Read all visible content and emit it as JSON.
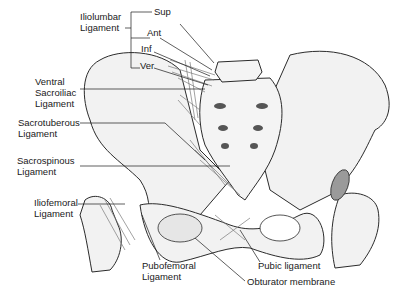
{
  "figure": {
    "colors": {
      "background": "#ffffff",
      "bone_fill": "#f2f2f2",
      "bone_outline": "#2b2b2b",
      "ligament": "#7a7a7a",
      "cartilage_fill": "#9a9a9a",
      "leader_line": "#1a1a1a",
      "text": "#1a1a1a"
    }
  },
  "labels": {
    "iliolumbar": {
      "line1": "Iliolumbar",
      "line2": "Ligament"
    },
    "iliolumbar_parts": {
      "sup": "Sup",
      "ant": "Ant",
      "inf": "Inf",
      "ver": "Ver"
    },
    "ventral_sacroiliac": {
      "line1": "Ventral",
      "line2": "Sacroiliac",
      "line3": "Ligament"
    },
    "sacrotuberous": {
      "line1": "Sacrotuberous",
      "line2": "Ligament"
    },
    "sacrospinous": {
      "line1": "Sacrospinous",
      "line2": "Ligament"
    },
    "iliofemoral": {
      "line1": "Iliofemoral",
      "line2": "Ligament"
    },
    "pubofemoral": {
      "line1": "Pubofemoral",
      "line2": "Ligament"
    },
    "pubic": {
      "line1": "Pubic ligament"
    },
    "obturator": {
      "line1": "Obturator membrane"
    }
  }
}
